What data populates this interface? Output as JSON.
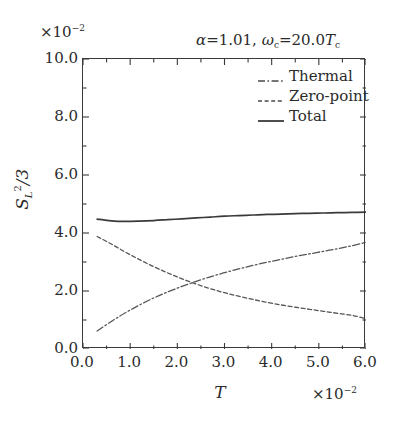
{
  "figure": {
    "annotation": {
      "alpha_symbol": "α",
      "alpha_eq": "=1.01,",
      "omega_symbol": "ω",
      "omega_sub": "c",
      "omega_eq": "=20.0",
      "tc_symbol": "T",
      "tc_sub": "c"
    },
    "y_multiplier_prefix": "×10",
    "y_multiplier_exp": "−2",
    "x_multiplier_prefix": "×10",
    "x_multiplier_exp": "−2",
    "y_axis_title_main": "S",
    "y_axis_title_sub": "L",
    "y_axis_title_sup": "2",
    "y_axis_title_tail": "/3",
    "x_axis_title": "T"
  },
  "legend": {
    "items": [
      {
        "label": "Thermal",
        "style": "dashdot",
        "color": "#4a4a4a"
      },
      {
        "label": "Zero-point",
        "style": "dashed",
        "color": "#4a4a4a"
      },
      {
        "label": "Total",
        "style": "solid",
        "color": "#3a3a3a"
      }
    ]
  },
  "chart_data": {
    "type": "line",
    "title": "",
    "xlabel": "T",
    "ylabel": "S_L^2/3",
    "xlim": [
      0.0,
      6.0
    ],
    "ylim": [
      0.0,
      10.0
    ],
    "x_multiplier": 0.01,
    "y_multiplier": 0.01,
    "grid": false,
    "legend_position": "top-right",
    "annotation": "α=1.01, ω_c=20.0T_c",
    "xticks": [
      "0.0",
      "1.0",
      "2.0",
      "3.0",
      "4.0",
      "5.0",
      "6.0"
    ],
    "xtick_values": [
      0.0,
      1.0,
      2.0,
      3.0,
      4.0,
      5.0,
      6.0
    ],
    "yticks": [
      "0.0",
      "2.0",
      "4.0",
      "6.0",
      "8.0",
      "10.0"
    ],
    "ytick_values": [
      0.0,
      2.0,
      4.0,
      6.0,
      8.0,
      10.0
    ],
    "x": [
      0.3,
      0.6,
      0.9,
      1.2,
      1.5,
      1.8,
      2.1,
      2.4,
      2.7,
      3.0,
      3.3,
      3.6,
      3.9,
      4.2,
      4.5,
      4.8,
      5.1,
      5.4,
      5.7,
      6.0
    ],
    "series": [
      {
        "name": "Thermal",
        "style": "dashdot",
        "values": [
          0.62,
          0.95,
          1.25,
          1.52,
          1.76,
          1.97,
          2.16,
          2.33,
          2.49,
          2.63,
          2.76,
          2.88,
          2.99,
          3.09,
          3.19,
          3.28,
          3.37,
          3.46,
          3.56,
          3.68
        ]
      },
      {
        "name": "Zero-point",
        "style": "dashed",
        "values": [
          3.88,
          3.62,
          3.34,
          3.08,
          2.84,
          2.62,
          2.42,
          2.24,
          2.08,
          1.94,
          1.82,
          1.71,
          1.61,
          1.52,
          1.44,
          1.37,
          1.3,
          1.23,
          1.16,
          1.05
        ]
      },
      {
        "name": "Total",
        "style": "solid",
        "values": [
          4.48,
          4.42,
          4.4,
          4.41,
          4.43,
          4.46,
          4.49,
          4.52,
          4.55,
          4.58,
          4.6,
          4.62,
          4.64,
          4.65,
          4.67,
          4.68,
          4.69,
          4.7,
          4.71,
          4.72
        ]
      }
    ]
  }
}
